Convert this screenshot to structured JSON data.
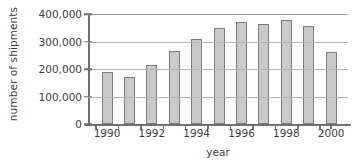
{
  "chart_data": {
    "type": "bar",
    "title": "",
    "xlabel": "year",
    "ylabel": "number of shipments",
    "categories": [
      "1990",
      "1991",
      "1992",
      "1993",
      "1994",
      "1995",
      "1996",
      "1997",
      "1998",
      "1999",
      "2000"
    ],
    "values": [
      190000,
      172000,
      213000,
      265000,
      308000,
      348000,
      370000,
      365000,
      379000,
      358000,
      263000
    ],
    "ylim": [
      0,
      400000
    ],
    "yticks": [
      0,
      100000,
      200000,
      300000,
      400000
    ],
    "ytick_labels": [
      "0",
      "100,000",
      "200,000",
      "300,000",
      "400,000"
    ],
    "xtick_labels_shown": [
      "1990",
      "1992",
      "1994",
      "1996",
      "1998",
      "2000"
    ],
    "grid": true,
    "legend": false,
    "bar_color": "#c9c9c9",
    "bar_border_color": "#7d7d7d",
    "grid_color": "#b4b4b4",
    "axis_color": "#6f6f6f",
    "text_color": "#3d3d3d"
  }
}
